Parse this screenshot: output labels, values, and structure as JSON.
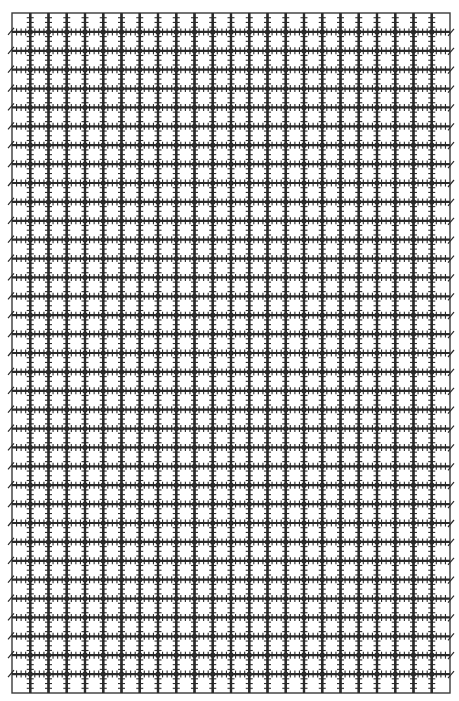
{
  "page": {
    "description": "Decorative graph-paper grid with hash-marked lines"
  },
  "grid": {
    "left": 12,
    "top": 13,
    "right": 450,
    "bottom": 693,
    "columns": 24,
    "rows": 36,
    "line_color": "#2a2a2a",
    "border_color": "#3a3a3a",
    "line_width": 2.2,
    "border_width": 1.4,
    "tick_length": 3.5,
    "ticks_per_cell": 3,
    "node_radius": 2.6,
    "background": "#ffffff"
  }
}
